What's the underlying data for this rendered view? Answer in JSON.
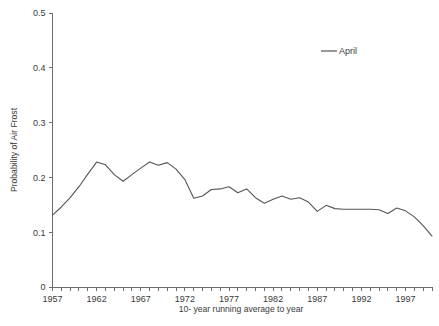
{
  "chart_data": {
    "type": "line",
    "title": "",
    "xlabel": "10- year running average to year",
    "ylabel": "Probability of Air Frost",
    "xlim": [
      1957,
      2000
    ],
    "ylim": [
      0,
      0.5
    ],
    "grid": false,
    "legend_position": "top-right",
    "y_ticks": [
      "0",
      "0.1",
      "0.2",
      "0.3",
      "0.4",
      "0.5"
    ],
    "y_tick_values": [
      0,
      0.1,
      0.2,
      0.3,
      0.4,
      0.5
    ],
    "x_ticks": [
      "1957",
      "1962",
      "1967",
      "1972",
      "1977",
      "1982",
      "1987",
      "1992",
      "1997"
    ],
    "x_tick_values": [
      1957,
      1962,
      1967,
      1972,
      1977,
      1982,
      1987,
      1992,
      1997
    ],
    "x_minor_step": 1,
    "series": [
      {
        "name": "April",
        "color": "#555555",
        "x": [
          1957,
          1958,
          1959,
          1960,
          1961,
          1962,
          1963,
          1964,
          1965,
          1966,
          1967,
          1968,
          1969,
          1970,
          1971,
          1972,
          1973,
          1974,
          1975,
          1976,
          1977,
          1978,
          1979,
          1980,
          1981,
          1982,
          1983,
          1984,
          1985,
          1986,
          1987,
          1988,
          1989,
          1990,
          1991,
          1992,
          1993,
          1994,
          1995,
          1996,
          1997,
          1998,
          1999,
          2000
        ],
        "values": [
          0.131,
          0.146,
          0.163,
          0.183,
          0.206,
          0.228,
          0.223,
          0.205,
          0.193,
          0.205,
          0.217,
          0.228,
          0.222,
          0.227,
          0.215,
          0.196,
          0.162,
          0.166,
          0.178,
          0.179,
          0.183,
          0.172,
          0.179,
          0.163,
          0.153,
          0.16,
          0.166,
          0.16,
          0.163,
          0.155,
          0.138,
          0.149,
          0.143,
          0.142,
          0.142,
          0.142,
          0.142,
          0.141,
          0.134,
          0.144,
          0.139,
          0.128,
          0.112,
          0.093
        ]
      }
    ]
  },
  "legend": {
    "entries": [
      {
        "label": "April"
      }
    ]
  },
  "axes": {
    "y_label": "Probability of Air Frost",
    "x_label": "10- year running average to year"
  }
}
